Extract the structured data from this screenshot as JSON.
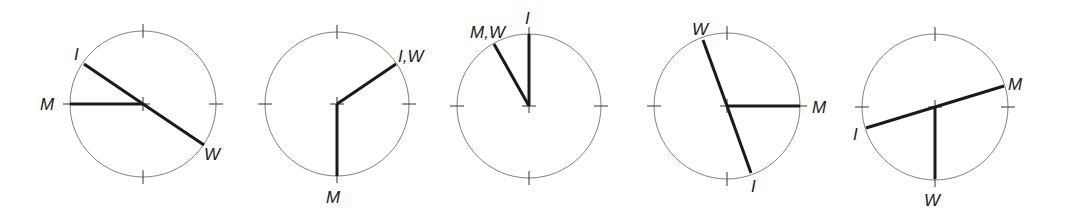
{
  "diagrams": [
    {
      "center": [
        143,
        104
      ],
      "radius": 73,
      "hands": [
        {
          "label": "M",
          "end": [
            70,
            104
          ]
        },
        {
          "label": "I",
          "end": [
            84,
            64
          ]
        },
        {
          "label": "W",
          "end": [
            204,
            145
          ]
        }
      ],
      "labels": [
        {
          "text": "M",
          "x": 40,
          "y": 110
        },
        {
          "text": "I",
          "x": 74,
          "y": 60
        },
        {
          "text": "W",
          "x": 204,
          "y": 160
        }
      ]
    },
    {
      "center": [
        337,
        104
      ],
      "radius": 72,
      "hands": [
        {
          "label": "I,W",
          "end": [
            396,
            64
          ]
        },
        {
          "label": "M",
          "end": [
            337,
            176
          ]
        }
      ],
      "labels": [
        {
          "text": "I,W",
          "x": 398,
          "y": 62
        },
        {
          "text": "M",
          "x": 326,
          "y": 203
        }
      ]
    },
    {
      "center": [
        529,
        106
      ],
      "radius": 72,
      "hands": [
        {
          "label": "I",
          "end": [
            529,
            34
          ]
        },
        {
          "label": "M,W",
          "end": [
            494,
            44
          ]
        }
      ],
      "labels": [
        {
          "text": "I",
          "x": 525,
          "y": 24
        },
        {
          "text": "M,W",
          "x": 470,
          "y": 38
        }
      ]
    },
    {
      "center": [
        727,
        106
      ],
      "radius": 73,
      "hands": [
        {
          "label": "W",
          "end": [
            703,
            40
          ]
        },
        {
          "label": "I",
          "end": [
            751,
            173
          ]
        },
        {
          "label": "M",
          "end": [
            800,
            106
          ]
        }
      ],
      "labels": [
        {
          "text": "W",
          "x": 692,
          "y": 35
        },
        {
          "text": "I",
          "x": 751,
          "y": 192
        },
        {
          "text": "M",
          "x": 812,
          "y": 113
        }
      ]
    },
    {
      "center": [
        935,
        107
      ],
      "radius": 73,
      "hands": [
        {
          "label": "M",
          "end": [
            1004,
            86
          ]
        },
        {
          "label": "I",
          "end": [
            866,
            128
          ]
        },
        {
          "label": "W",
          "end": [
            935,
            179
          ]
        }
      ],
      "labels": [
        {
          "text": "M",
          "x": 1008,
          "y": 90
        },
        {
          "text": "I",
          "x": 853,
          "y": 140
        },
        {
          "text": "W",
          "x": 924,
          "y": 206
        }
      ]
    }
  ]
}
